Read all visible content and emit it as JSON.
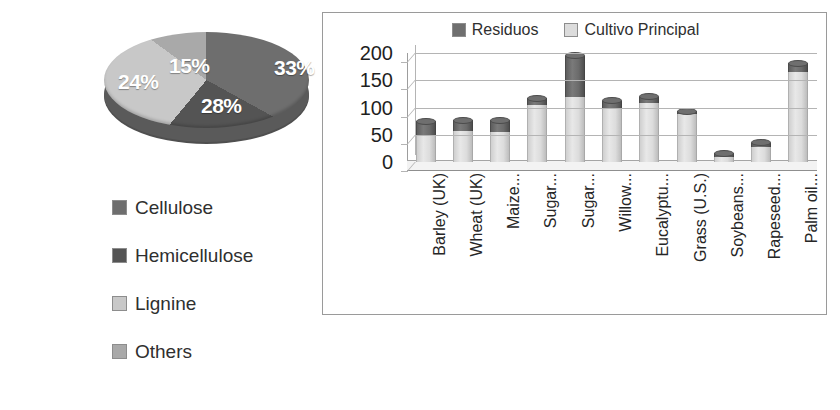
{
  "pie": {
    "labels_on_slices": [
      "33%",
      "28%",
      "24%",
      "15%"
    ],
    "legend": [
      {
        "label": "Cellulose",
        "color": "#6e6e6e"
      },
      {
        "label": "Hemicellulose",
        "color": "#545454"
      },
      {
        "label": "Lignine",
        "color": "#c8c8c8"
      },
      {
        "label": "Others",
        "color": "#a9a9a9"
      }
    ]
  },
  "bar": {
    "legend": [
      {
        "label": "Residuos",
        "color": "#6f6f6f"
      },
      {
        "label": "Cultivo Principal",
        "color": "#dcdcdc"
      }
    ]
  },
  "chart_data": [
    {
      "type": "pie",
      "title": "",
      "labels": [
        "Cellulose",
        "Hemicellulose",
        "Lignine",
        "Others"
      ],
      "values": [
        33,
        28,
        24,
        15
      ],
      "value_labels": [
        "33%",
        "28%",
        "24%",
        "15%"
      ],
      "colors": [
        "#6e6e6e",
        "#545454",
        "#c8c8c8",
        "#a9a9a9"
      ],
      "legend_position": "bottom-left",
      "three_d": true
    },
    {
      "type": "bar",
      "subtype": "stacked-3d",
      "title": "",
      "xlabel": "",
      "ylabel": "",
      "ylim": [
        0,
        200
      ],
      "yticks": [
        0,
        50,
        100,
        150,
        200
      ],
      "grid": true,
      "legend_position": "top",
      "categories": [
        "Barley (UK)",
        "Wheat (UK)",
        "Maize...",
        "Sugar...",
        "Sugar...",
        "Willow...",
        "Eucalyptu...",
        "Grass (U.S.)",
        "Soybeans...",
        "Rapeseed...",
        "Palm oil..."
      ],
      "series": [
        {
          "name": "Cultivo Principal",
          "color": "#dcdcdc",
          "values": [
            48,
            57,
            55,
            105,
            120,
            100,
            108,
            88,
            10,
            27,
            165
          ]
        },
        {
          "name": "Residuos",
          "color": "#6f6f6f",
          "values": [
            27,
            20,
            22,
            12,
            75,
            12,
            12,
            5,
            6,
            8,
            16
          ]
        }
      ],
      "totals": [
        75,
        77,
        77,
        117,
        195,
        112,
        120,
        93,
        16,
        35,
        181
      ]
    }
  ]
}
